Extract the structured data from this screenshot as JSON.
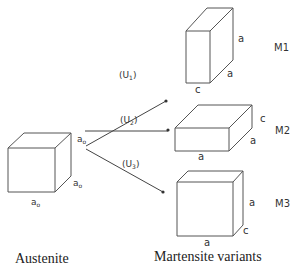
{
  "austenite": {
    "caption": "Austenite",
    "edge_labels": {
      "top": "a",
      "top_sub": "o",
      "side": "a",
      "side_sub": "o",
      "bottom": "a",
      "bottom_sub": "o"
    }
  },
  "transformations": [
    {
      "label": "(U",
      "sub": "1",
      "close": ")"
    },
    {
      "label": "(U",
      "sub": "2",
      "close": ")"
    },
    {
      "label": "(U",
      "sub": "3",
      "close": ")"
    }
  ],
  "variants": {
    "caption": "Martensite variants",
    "items": [
      {
        "name": "M1",
        "labels": {
          "height": "a",
          "depth": "a",
          "width": "c"
        }
      },
      {
        "name": "M2",
        "labels": {
          "height": "c",
          "depth": "a",
          "width": "a"
        }
      },
      {
        "name": "M3",
        "labels": {
          "height": "a",
          "depth": "c",
          "width": "a"
        }
      }
    ]
  }
}
